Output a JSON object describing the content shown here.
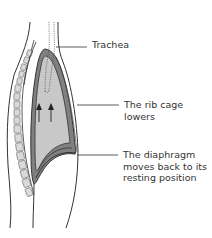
{
  "diagram": {
    "labels": {
      "trachea": "Trachea",
      "rib_cage_line1": "The rib cage",
      "rib_cage_line2": "lowers",
      "diaphragm_line1": "The diaphragm",
      "diaphragm_line2": "moves back to its",
      "diaphragm_line3": "resting position"
    },
    "colors": {
      "outline": "#333333",
      "lung_fill": "#c8c8c8",
      "pleura_band": "#808080",
      "vertebra_fill": "#d9d9d9",
      "text": "#333333"
    },
    "arrows": {
      "count": 2,
      "direction": "up"
    }
  }
}
